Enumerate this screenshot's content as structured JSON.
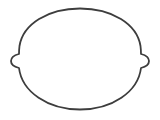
{
  "canvas": {
    "width": 160,
    "height": 120,
    "background": "#ffffff"
  },
  "shape": {
    "kind": "outline-oval-with-side-tabs",
    "icon": "lemon-outline-icon",
    "stroke_color": "#3d3d3d",
    "stroke_width": 1.8,
    "fill": "none",
    "path": "M 80 8.5 C 112 8.5 137 24 140.5 46 C 141 50 141 53 141 54 C 145 55 149 57 149 61 C 149 65 145 67 141 68 C 138 92 112 109.5 80 109.5 C 48 109.5 22 92 19 68 C 15 67 11 65 11 61 C 11 57 15 55 19 54 C 19 53 19 50 19.5 46 C 23 24 48 8.5 80 8.5 Z"
  }
}
